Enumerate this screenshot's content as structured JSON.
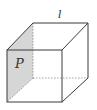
{
  "diagram": {
    "type": "cube-with-plane",
    "labels": {
      "plane": "P",
      "line": "l"
    },
    "colors": {
      "edge": "#3a3a3a",
      "hidden_edge": "#8a8a8a",
      "plane_fill": "#d6d6d6",
      "label": "#333333"
    }
  }
}
